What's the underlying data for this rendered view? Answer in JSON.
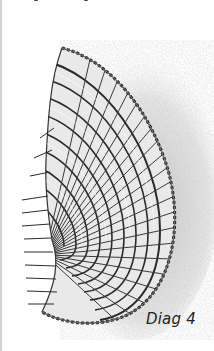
{
  "figure": {
    "caption": "Diag 4",
    "colors": {
      "ink": "#2a2a2a",
      "shading": "#9a9a9a",
      "background": "#ffffff",
      "rule": "#d4d4d4"
    }
  }
}
